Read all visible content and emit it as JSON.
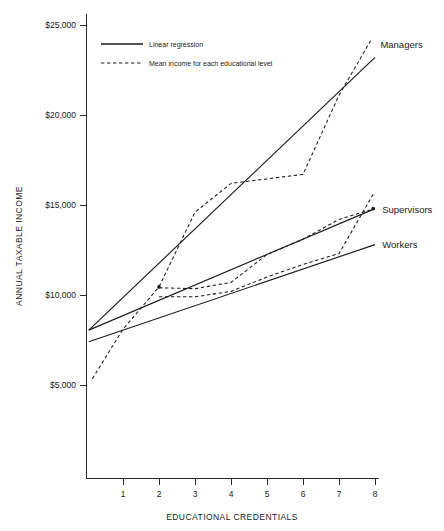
{
  "chart_data": {
    "type": "line",
    "title": "",
    "xlabel": "EDUCATIONAL CREDENTIALS",
    "ylabel": "ANNUAL TAXABLE INCOME",
    "xlim": [
      0,
      8.35
    ],
    "ylim": [
      3200,
      25600
    ],
    "xticks": [
      1,
      2,
      3,
      4,
      5,
      6,
      7,
      8
    ],
    "xticklabels": [
      "1",
      "2",
      "3",
      "4",
      "5",
      "6",
      "7",
      "8"
    ],
    "yticks": [
      5000,
      10000,
      15000,
      20000,
      25000
    ],
    "yticklabels": [
      "$5,000",
      "$10,000",
      "$15,000",
      "$20,000",
      "$25,000"
    ],
    "grid": false,
    "legend": {
      "position": "upper-left-inside",
      "entries": [
        {
          "label": "Linear regression",
          "style": "solid"
        },
        {
          "label": "Mean income for each educational level",
          "style": "dashed"
        }
      ]
    },
    "group_labels": [
      {
        "name": "Managers",
        "x": 8.15,
        "y": 23900
      },
      {
        "name": "Supervisors",
        "x": 8.2,
        "y": 14750
      },
      {
        "name": "Workers",
        "x": 8.2,
        "y": 12800
      }
    ],
    "series": [
      {
        "name": "Managers mean income",
        "group": "Managers",
        "style": "dashed",
        "x": [
          0.15,
          1.0,
          2.0,
          3.0,
          4.0,
          5.0,
          6.0,
          7.0,
          7.9
        ],
        "values": [
          5350,
          8100,
          10450,
          14600,
          16200,
          16450,
          16700,
          21100,
          24200
        ]
      },
      {
        "name": "Managers linear regression",
        "group": "Managers",
        "style": "solid",
        "x": [
          0.05,
          8.0
        ],
        "values": [
          8050,
          23200
        ]
      },
      {
        "name": "Supervisors mean income",
        "group": "Supervisors",
        "style": "dashed",
        "x": [
          2.0,
          3.0,
          4.0,
          5.0,
          6.0,
          7.0,
          8.0
        ],
        "values": [
          10400,
          10350,
          10700,
          12250,
          13100,
          14200,
          14800
        ]
      },
      {
        "name": "Supervisors linear regression",
        "group": "Supervisors",
        "style": "solid",
        "x": [
          0.05,
          8.0
        ],
        "values": [
          8050,
          14800
        ]
      },
      {
        "name": "Workers mean income",
        "group": "Workers",
        "style": "dashed",
        "x": [
          2.0,
          3.0,
          4.0,
          5.0,
          6.0,
          7.0,
          7.95
        ],
        "values": [
          9900,
          9900,
          10200,
          11000,
          11700,
          12300,
          15600
        ]
      },
      {
        "name": "Workers linear regression",
        "group": "Workers",
        "style": "solid",
        "x": [
          0.05,
          8.0
        ],
        "values": [
          7400,
          12800
        ]
      }
    ],
    "marked_nodes": [
      {
        "x": 2.0,
        "y": 10450
      },
      {
        "x": 7.95,
        "y": 14800
      }
    ]
  }
}
